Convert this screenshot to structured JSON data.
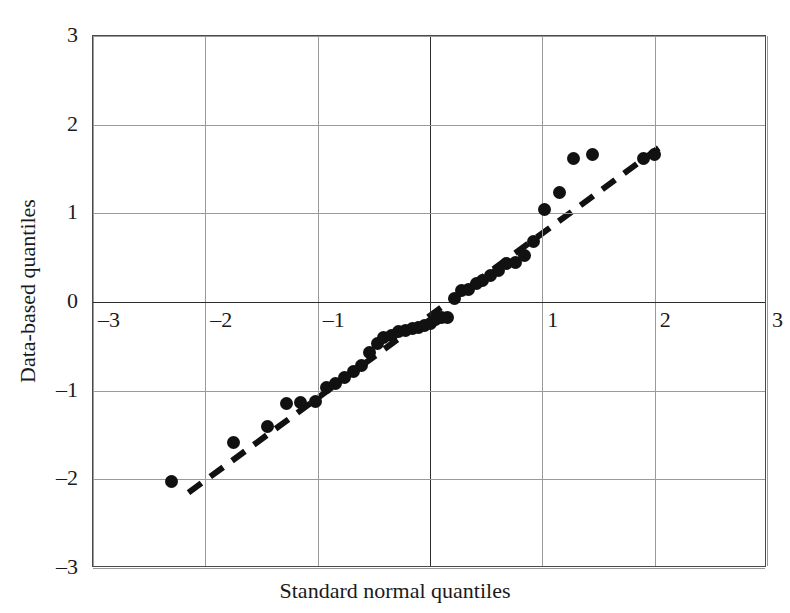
{
  "chart_data": {
    "type": "scatter",
    "title": "",
    "xlabel": "Standard normal quantiles",
    "ylabel": "Data-based quantiles",
    "xlim": [
      -3,
      3
    ],
    "ylim": [
      -3,
      3
    ],
    "xticks": [
      "-3",
      "-2",
      "-1",
      "0",
      "1",
      "2",
      "3"
    ],
    "xtick_values": [
      -3,
      -2,
      -1,
      0,
      1,
      2,
      3
    ],
    "xticks_visible": [
      "-3",
      "-2",
      "-1",
      "1",
      "2",
      "3"
    ],
    "yticks": [
      "3",
      "2",
      "1",
      "0",
      "-1",
      "-2",
      "-3"
    ],
    "ytick_values": [
      3,
      2,
      1,
      0,
      -1,
      -2,
      -3
    ],
    "grid": true,
    "legend": "none",
    "series": [
      {
        "name": "sample quantiles",
        "marker": "filled-circle",
        "color": "#111111",
        "x": [
          -2.3,
          -1.75,
          -1.45,
          -1.28,
          -1.15,
          -1.02,
          -0.92,
          -0.84,
          -0.76,
          -0.68,
          -0.61,
          -0.54,
          -0.47,
          -0.41,
          -0.34,
          -0.28,
          -0.22,
          -0.16,
          -0.1,
          -0.05,
          0.0,
          0.05,
          0.1,
          0.16,
          0.22,
          0.28,
          0.34,
          0.41,
          0.47,
          0.54,
          0.61,
          0.68,
          0.76,
          0.84,
          0.92,
          1.02,
          1.15,
          1.28,
          1.45,
          1.9,
          2.0
        ],
        "y": [
          -2.02,
          -1.58,
          -1.4,
          -1.15,
          -1.13,
          -1.12,
          -0.96,
          -0.92,
          -0.85,
          -0.78,
          -0.72,
          -0.57,
          -0.47,
          -0.4,
          -0.38,
          -0.33,
          -0.32,
          -0.3,
          -0.29,
          -0.26,
          -0.24,
          -0.2,
          -0.18,
          -0.17,
          0.04,
          0.13,
          0.14,
          0.21,
          0.24,
          0.3,
          0.36,
          0.43,
          0.44,
          0.52,
          0.68,
          1.04,
          1.23,
          1.62,
          1.66,
          1.62,
          1.66
        ]
      }
    ],
    "reference_line": {
      "style": "dashed",
      "color": "#111111",
      "x_start": -2.15,
      "y_start": -2.15,
      "x_end": 2.05,
      "y_end": 1.75
    }
  }
}
